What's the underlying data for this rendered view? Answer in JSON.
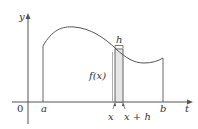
{
  "diagram": {
    "type": "area-under-curve",
    "axes": {
      "x_label": "t",
      "y_label": "y",
      "origin_label": "0"
    },
    "points": {
      "a": "a",
      "b": "b",
      "x": "x",
      "x_plus_h": "x + h"
    },
    "annotations": {
      "width_label": "h",
      "height_label": "f(x)"
    },
    "colors": {
      "stroke": "#555555",
      "strip_fill": "#e6e6e6",
      "text": "#333333"
    }
  }
}
